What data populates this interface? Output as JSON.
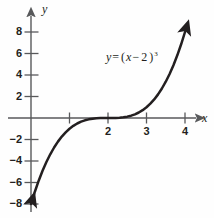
{
  "figure": {
    "background_color": "#fefefe",
    "ink_color": "#231f20",
    "axis_color": "#58595b"
  },
  "equation": {
    "lhs": "y",
    "equals": "=",
    "rhs_open": "(",
    "rhs_var": "x",
    "rhs_minus": "−",
    "rhs_const": "2",
    "rhs_close": ")",
    "exponent": "3",
    "plain": "y = (x − 2)³"
  },
  "axes": {
    "x_name": "x",
    "y_name": "y",
    "x_ticks": [
      {
        "value": 1,
        "label": ""
      },
      {
        "value": 2,
        "label": "2"
      },
      {
        "value": 3,
        "label": "3"
      },
      {
        "value": 4,
        "label": "4"
      }
    ],
    "y_ticks": [
      {
        "value": 8,
        "label": "8"
      },
      {
        "value": 6,
        "label": "6"
      },
      {
        "value": 4,
        "label": "4"
      },
      {
        "value": 2,
        "label": "2"
      },
      {
        "value": -2,
        "label": "−2"
      },
      {
        "value": -4,
        "label": "−4"
      },
      {
        "value": -6,
        "label": "−6"
      },
      {
        "value": -8,
        "label": "−8"
      }
    ]
  },
  "chart_data": {
    "type": "line",
    "title": "",
    "xlabel": "x",
    "ylabel": "y",
    "xlim": [
      -0.1,
      4.55
    ],
    "ylim": [
      -8.9,
      9.0
    ],
    "grid": false,
    "legend": "none",
    "annotations": [
      {
        "text": "y = (x − 2)³",
        "x": 2.05,
        "y": 5.1
      }
    ],
    "xticks": [
      1,
      2,
      3,
      4
    ],
    "xticklabels": [
      "",
      "2",
      "3",
      "4"
    ],
    "yticks": [
      8,
      6,
      4,
      2,
      -2,
      -4,
      -6,
      -8
    ],
    "yticklabels": [
      "8",
      "6",
      "4",
      "2",
      "−2",
      "−4",
      "−6",
      "−8"
    ],
    "series": [
      {
        "name": "y = (x - 2)^3",
        "expression": "(x-2)^3",
        "arrow_start": true,
        "arrow_end": true,
        "x": [
          0.0,
          0.1,
          0.2,
          0.3,
          0.4,
          0.5,
          0.6,
          0.7,
          0.8,
          0.9,
          1.0,
          1.1,
          1.2,
          1.3,
          1.4,
          1.5,
          1.6,
          1.7,
          1.8,
          1.9,
          2.0,
          2.1,
          2.2,
          2.3,
          2.4,
          2.5,
          2.6,
          2.7,
          2.8,
          2.9,
          3.0,
          3.1,
          3.2,
          3.3,
          3.4,
          3.5,
          3.6,
          3.7,
          3.8,
          3.9,
          4.0
        ],
        "y": [
          -8.0,
          -6.859,
          -5.832,
          -4.913,
          -4.096,
          -3.375,
          -2.744,
          -2.197,
          -1.728,
          -1.331,
          -1.0,
          -0.729,
          -0.512,
          -0.343,
          -0.216,
          -0.125,
          -0.064,
          -0.027,
          -0.008,
          -0.001,
          0.0,
          0.001,
          0.008,
          0.027,
          0.064,
          0.125,
          0.216,
          0.343,
          0.512,
          0.729,
          1.0,
          1.331,
          1.728,
          2.197,
          2.744,
          3.375,
          4.096,
          4.913,
          5.832,
          6.859,
          8.0
        ]
      }
    ]
  }
}
